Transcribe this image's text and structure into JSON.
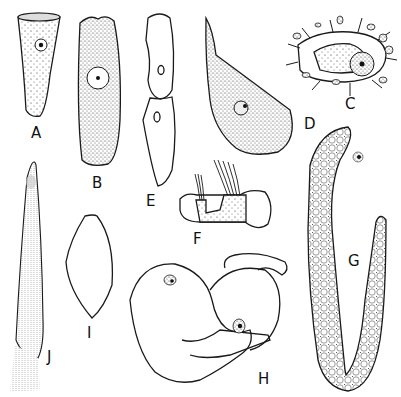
{
  "figure": {
    "panels": [
      {
        "id": "A",
        "label": "A",
        "description": "cone-shaped cell with ciliated rim and central nucleus"
      },
      {
        "id": "B",
        "label": "B",
        "description": "elongated ciliate with striated anterior and large nucleus"
      },
      {
        "id": "C",
        "label": "C",
        "description": "oval cell with radiating processes surrounded by small cells"
      },
      {
        "id": "D",
        "label": "D",
        "description": "stippled amoeboid cell with tapered apex and nucleus"
      },
      {
        "id": "E",
        "label": "E",
        "description": "two-part elongate cell outline with two vacuoles"
      },
      {
        "id": "F",
        "label": "F",
        "description": "stippled cell with two ciliary tufts"
      },
      {
        "id": "G",
        "label": "G",
        "description": "long U-shaped vacuolated cell with nucleus"
      },
      {
        "id": "H",
        "label": "H",
        "description": "bulbous lobed cells with two nuclei"
      },
      {
        "id": "I",
        "label": "I",
        "description": "spindle-shaped lorica outline"
      },
      {
        "id": "J",
        "label": "J",
        "description": "long striated tubular cell with fringed base"
      }
    ]
  }
}
